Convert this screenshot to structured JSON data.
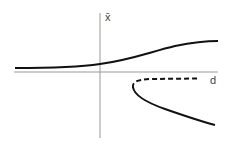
{
  "diagram": {
    "title": "",
    "y_axis_label": "x̄",
    "x_axis_label": "d",
    "curves": [
      {
        "name": "upper-stable-branch",
        "style": "solid"
      },
      {
        "name": "unstable-branch",
        "style": "dashed"
      },
      {
        "name": "lower-stable-branch",
        "style": "solid"
      }
    ],
    "colors": {
      "axis": "#888888",
      "curve": "#111111"
    }
  }
}
